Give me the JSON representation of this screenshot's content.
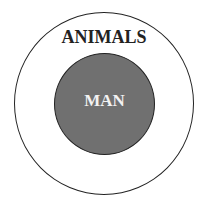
{
  "diagram": {
    "type": "nested-circles",
    "outer": {
      "label": "ANIMALS",
      "fill": "#ffffff",
      "text_color": "#222222"
    },
    "inner": {
      "label": "MAN",
      "fill": "#707070",
      "text_color": "#f2f2f2"
    }
  }
}
